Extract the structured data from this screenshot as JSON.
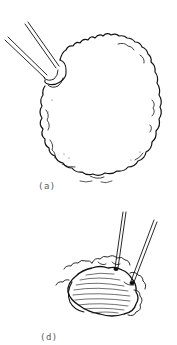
{
  "figure": {
    "style": "black line drawing on white background",
    "colors": {
      "background": "#ffffff",
      "line": "#111111",
      "label": "#5a5a5a"
    },
    "panels": [
      {
        "label": "(a)",
        "description": "Large rounded, cloud-edged mass grasped at upper-left by forceps",
        "icon": "forceps-icon"
      },
      {
        "label": "(d)",
        "description": "Smaller striated tissue mass with surrounding cloud-edged outline, two forceps inserted from above",
        "icon": "forceps-icon"
      }
    ]
  }
}
